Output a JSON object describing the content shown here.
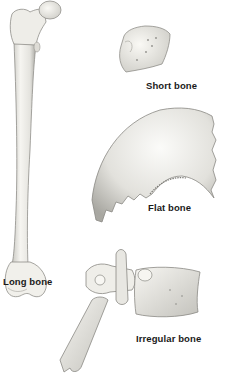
{
  "figure": {
    "labels": {
      "long": "Long bone",
      "short": "Short bone",
      "flat": "Flat bone",
      "irregular": "Irregular bone"
    },
    "colors": {
      "bone_fill": "#f1f0ec",
      "bone_shade": "#b9b8b2",
      "outline": "#8a8a86",
      "label": "#1a1a1a",
      "background": "#ffffff"
    }
  }
}
